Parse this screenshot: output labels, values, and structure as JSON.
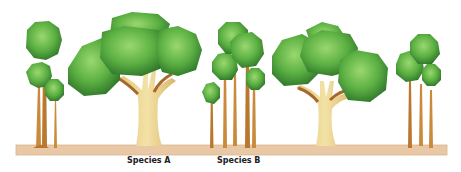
{
  "figure": {
    "type": "illustration",
    "colors": {
      "ground": "#e9c9a5",
      "ground_edge": "#d9b48c",
      "foliage_light": "#8fd06a",
      "foliage_mid": "#5fb045",
      "foliage_dark": "#2f7a2c",
      "slender_trunk": "#c98a3c",
      "stout_trunk": "#ecd58e",
      "branch": "#a56a2a"
    },
    "labels": {
      "species_a": "Species A",
      "species_b": "Species B"
    },
    "groups": [
      {
        "name": "slender-group-left",
        "trees": 3
      },
      {
        "name": "broad-tree-species-a",
        "trees": 1
      },
      {
        "name": "slender-group-species-b",
        "trees": 5
      },
      {
        "name": "broad-tree-right",
        "trees": 1
      },
      {
        "name": "slender-group-right",
        "trees": 3
      }
    ]
  }
}
